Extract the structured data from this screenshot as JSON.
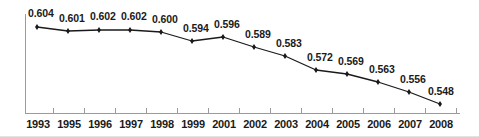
{
  "chart_data": {
    "type": "line",
    "title": "",
    "subtitle": "",
    "xlabel": "",
    "ylabel": "",
    "grid": false,
    "legend": false,
    "legend_position": "none",
    "marker": "diamond",
    "line_color": "#1a1a1a",
    "marker_color": "#1a1a1a",
    "axis_color": "#9b9b9b",
    "label_color": "#1a1a1a",
    "categories": [
      "1993",
      "1995",
      "1996",
      "1997",
      "1998",
      "1999",
      "2001",
      "2002",
      "2003",
      "2004",
      "2005",
      "2006",
      "2007",
      "2008"
    ],
    "values": [
      0.604,
      0.601,
      0.602,
      0.602,
      0.6,
      0.594,
      0.596,
      0.589,
      0.583,
      0.572,
      0.569,
      0.563,
      0.556,
      0.548
    ],
    "value_labels": [
      "0.604",
      "0.601",
      "0.602",
      "0.602",
      "0.600",
      "0.594",
      "0.596",
      "0.589",
      "0.583",
      "0.572",
      "0.569",
      "0.563",
      "0.556",
      "0.548"
    ],
    "ylim": [
      0.52,
      0.612
    ],
    "xtick_labels_shown": true,
    "ytick_labels_shown": false,
    "points_px": [
      {
        "x": 37,
        "y": 27
      },
      {
        "x": 68,
        "y": 31
      },
      {
        "x": 99,
        "y": 30
      },
      {
        "x": 130,
        "y": 30
      },
      {
        "x": 161,
        "y": 32
      },
      {
        "x": 192,
        "y": 41
      },
      {
        "x": 223,
        "y": 37
      },
      {
        "x": 254,
        "y": 47
      },
      {
        "x": 285,
        "y": 56
      },
      {
        "x": 316,
        "y": 70
      },
      {
        "x": 347,
        "y": 74
      },
      {
        "x": 378,
        "y": 82
      },
      {
        "x": 409,
        "y": 92
      },
      {
        "x": 440,
        "y": 104
      }
    ],
    "labels_px": [
      {
        "x": 28,
        "y": 8
      },
      {
        "x": 59,
        "y": 13
      },
      {
        "x": 90,
        "y": 11
      },
      {
        "x": 121,
        "y": 11
      },
      {
        "x": 152,
        "y": 14
      },
      {
        "x": 183,
        "y": 23
      },
      {
        "x": 214,
        "y": 19
      },
      {
        "x": 245,
        "y": 29
      },
      {
        "x": 276,
        "y": 38
      },
      {
        "x": 307,
        "y": 52
      },
      {
        "x": 338,
        "y": 56
      },
      {
        "x": 369,
        "y": 64
      },
      {
        "x": 400,
        "y": 74
      },
      {
        "x": 428,
        "y": 86
      }
    ],
    "xtick_label_px": [
      {
        "x": 22,
        "w": 32
      },
      {
        "x": 53,
        "w": 32
      },
      {
        "x": 84,
        "w": 32
      },
      {
        "x": 115,
        "w": 32
      },
      {
        "x": 146,
        "w": 32
      },
      {
        "x": 177,
        "w": 32
      },
      {
        "x": 208,
        "w": 32
      },
      {
        "x": 239,
        "w": 32
      },
      {
        "x": 270,
        "w": 32
      },
      {
        "x": 301,
        "w": 32
      },
      {
        "x": 332,
        "w": 32
      },
      {
        "x": 363,
        "w": 32
      },
      {
        "x": 394,
        "w": 32
      },
      {
        "x": 425,
        "w": 32
      }
    ],
    "axis": {
      "y_axis_x": 25,
      "y_axis_top": 14,
      "y_axis_bottom": 113,
      "x_axis_y": 113,
      "x_axis_left": 25,
      "x_axis_right": 460,
      "tick_height": 5,
      "tick_xs": [
        25,
        53,
        84,
        115,
        146,
        177,
        208,
        239,
        270,
        301,
        332,
        363,
        394,
        425,
        456
      ]
    }
  }
}
